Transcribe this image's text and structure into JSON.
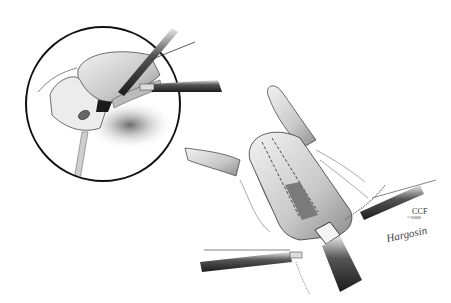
{
  "illustration": {
    "description": "Grayscale surgical illustration of laparoscopic procedure with circular inset detail",
    "inset": {
      "shape": "circle",
      "center": [
        103,
        104
      ],
      "radius": 77,
      "stroke": "#111111"
    },
    "main_view": {
      "organ": "tubular structure with dashed staple lines",
      "instruments": 4
    },
    "colors": {
      "background": "#ffffff",
      "ink": "#1a1a1a",
      "shade": "#8a8a8a",
      "light_shade": "#d0d0d0"
    }
  },
  "signature": {
    "org": "CCF",
    "date": "©2000",
    "artist": "Hargosin"
  }
}
